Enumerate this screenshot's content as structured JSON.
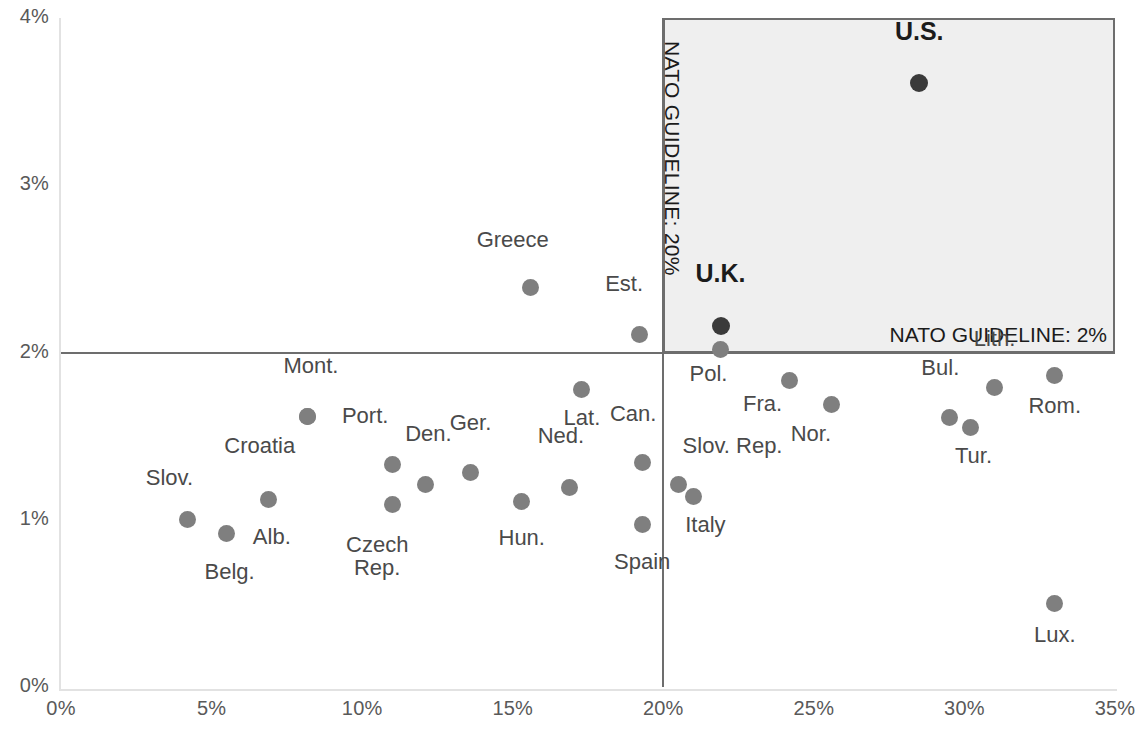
{
  "chart_data": {
    "type": "scatter",
    "title": "",
    "xlabel": "",
    "ylabel": "",
    "xlim": [
      0,
      35
    ],
    "ylim": [
      0,
      4
    ],
    "x_ticks": [
      "0%",
      "5%",
      "10%",
      "15%",
      "20%",
      "25%",
      "30%",
      "35%"
    ],
    "y_ticks": [
      "0%",
      "1%",
      "2%",
      "3%",
      "4%"
    ],
    "x_tick_values": [
      0,
      5,
      10,
      15,
      20,
      25,
      30,
      35
    ],
    "y_tick_values": [
      0,
      1,
      2,
      3,
      4
    ],
    "grid": false,
    "legend": "none",
    "annotations": [
      {
        "text": "NATO GUIDELINE: 20%",
        "orientation": "vertical",
        "value": 20,
        "axis": "x"
      },
      {
        "text": "NATO GUIDELINE: 2%",
        "orientation": "horizontal",
        "value": 2,
        "axis": "y"
      }
    ],
    "highlight_region": {
      "x_from": 20,
      "x_to": 35,
      "y_from": 2,
      "y_to": 4,
      "color": "#efefef"
    },
    "points": [
      {
        "label": "Slov.",
        "x": 4.2,
        "y": 1.0,
        "lx": 3.6,
        "ly": 1.19,
        "align": "c",
        "style": "normal"
      },
      {
        "label": "Belg.",
        "x": 5.5,
        "y": 0.92,
        "lx": 5.6,
        "ly": 0.63,
        "align": "c",
        "style": "normal"
      },
      {
        "label": "Alb.",
        "x": 6.9,
        "y": 1.12,
        "lx": 7.0,
        "ly": 0.84,
        "align": "c",
        "style": "normal"
      },
      {
        "label": "Croatia",
        "x": 8.2,
        "y": 1.62,
        "lx": 6.6,
        "ly": 1.38,
        "align": "c",
        "style": "normal"
      },
      {
        "label": "Mont.",
        "x": 8.2,
        "y": 1.62,
        "lx": 8.3,
        "ly": 1.86,
        "align": "c",
        "style": "normal"
      },
      {
        "label": "Port.",
        "x": 11.0,
        "y": 1.33,
        "lx": 10.1,
        "ly": 1.56,
        "align": "c",
        "style": "normal"
      },
      {
        "label": "Czech Rep.",
        "x": 11.0,
        "y": 1.09,
        "lx": 10.5,
        "ly": 0.79,
        "align": "c",
        "style": "normal"
      },
      {
        "label": "Den.",
        "x": 12.1,
        "y": 1.21,
        "lx": 12.2,
        "ly": 1.45,
        "align": "c",
        "style": "normal"
      },
      {
        "label": "Ger.",
        "x": 13.6,
        "y": 1.28,
        "lx": 13.6,
        "ly": 1.52,
        "align": "c",
        "style": "normal"
      },
      {
        "label": "Greece",
        "x": 15.6,
        "y": 2.39,
        "lx": 15.0,
        "ly": 2.61,
        "align": "c",
        "style": "normal"
      },
      {
        "label": "Hun.",
        "x": 15.3,
        "y": 1.11,
        "lx": 15.3,
        "ly": 0.83,
        "align": "c",
        "style": "normal"
      },
      {
        "label": "Ned.",
        "x": 16.9,
        "y": 1.19,
        "lx": 16.6,
        "ly": 1.44,
        "align": "c",
        "style": "normal"
      },
      {
        "label": "Lat.",
        "x": 17.3,
        "y": 1.78,
        "lx": 17.3,
        "ly": 1.55,
        "align": "c",
        "style": "normal"
      },
      {
        "label": "Est.",
        "x": 19.2,
        "y": 2.11,
        "lx": 18.7,
        "ly": 2.35,
        "align": "c",
        "style": "normal"
      },
      {
        "label": "Can.",
        "x": 19.3,
        "y": 1.34,
        "lx": 19.0,
        "ly": 1.57,
        "align": "c",
        "style": "normal"
      },
      {
        "label": "Spain",
        "x": 19.3,
        "y": 0.97,
        "lx": 19.3,
        "ly": 0.69,
        "align": "c",
        "style": "normal"
      },
      {
        "label": "U.K.",
        "x": 21.9,
        "y": 2.16,
        "lx": 21.9,
        "ly": 2.42,
        "align": "c",
        "style": "bold"
      },
      {
        "label": "Pol.",
        "x": 21.9,
        "y": 2.02,
        "lx": 21.5,
        "ly": 1.81,
        "align": "c",
        "style": "normal"
      },
      {
        "label": "Slov. Rep.",
        "x": 20.5,
        "y": 1.21,
        "lx": 22.3,
        "ly": 1.38,
        "align": "c",
        "style": "normal"
      },
      {
        "label": "Italy",
        "x": 21.0,
        "y": 1.14,
        "lx": 21.4,
        "ly": 0.91,
        "align": "c",
        "style": "normal"
      },
      {
        "label": "Fra.",
        "x": 24.2,
        "y": 1.83,
        "lx": 23.3,
        "ly": 1.63,
        "align": "c",
        "style": "normal"
      },
      {
        "label": "Nor.",
        "x": 25.6,
        "y": 1.69,
        "lx": 24.9,
        "ly": 1.45,
        "align": "c",
        "style": "normal"
      },
      {
        "label": "U.S.",
        "x": 28.5,
        "y": 3.61,
        "lx": 28.5,
        "ly": 3.87,
        "align": "c",
        "style": "bold"
      },
      {
        "label": "Bul.",
        "x": 29.5,
        "y": 1.61,
        "lx": 29.2,
        "ly": 1.85,
        "align": "c",
        "style": "normal"
      },
      {
        "label": "Tur.",
        "x": 30.2,
        "y": 1.55,
        "lx": 30.3,
        "ly": 1.32,
        "align": "c",
        "style": "normal"
      },
      {
        "label": "Lith.",
        "x": 31.0,
        "y": 1.79,
        "lx": 31.0,
        "ly": 2.02,
        "align": "c",
        "style": "normal"
      },
      {
        "label": "Rom.",
        "x": 33.0,
        "y": 1.86,
        "lx": 33.0,
        "ly": 1.62,
        "align": "c",
        "style": "normal"
      },
      {
        "label": "Lux.",
        "x": 33.0,
        "y": 0.5,
        "lx": 33.0,
        "ly": 0.25,
        "align": "c",
        "style": "normal"
      }
    ]
  },
  "colors": {
    "dot": "#7f7f7f",
    "dot_highlight": "#3a3a3a",
    "shade": "#efefef",
    "guideline": "#6d6d6d",
    "axis": "#e2e2e2",
    "tick_text": "#595959",
    "label_text": "#4a4a4a"
  }
}
